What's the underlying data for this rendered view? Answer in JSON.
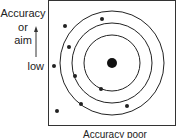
{
  "diagram": {
    "y_axis": {
      "line1": "Accuracy",
      "line2": "or",
      "line3": "aim",
      "low_label": "low"
    },
    "x_axis": {
      "label": "Accuracy poor"
    },
    "target": {
      "rings": 3,
      "center": "bullseye"
    },
    "shots": [
      {
        "x": 65,
        "y": 26
      },
      {
        "x": 102,
        "y": 19
      },
      {
        "x": 69,
        "y": 47
      },
      {
        "x": 54,
        "y": 66
      },
      {
        "x": 75,
        "y": 76
      },
      {
        "x": 101,
        "y": 89
      },
      {
        "x": 81,
        "y": 104
      },
      {
        "x": 127,
        "y": 106
      },
      {
        "x": 57,
        "y": 111
      }
    ]
  }
}
